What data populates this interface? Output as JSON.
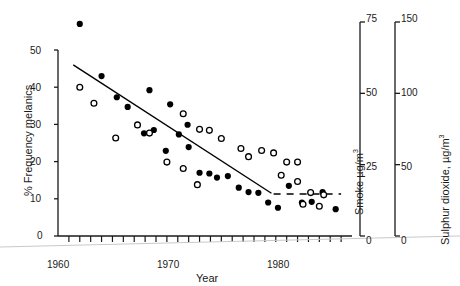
{
  "chart_data": {
    "type": "scatter",
    "title": "",
    "xlabel": "Year",
    "ylabel": "% Frequency melanics",
    "xlim": [
      1959,
      1986
    ],
    "ylim": [
      0,
      50
    ],
    "xticks": [
      1960,
      1970,
      1980
    ],
    "xtick_labels": [
      "1960",
      "1970",
      "1980"
    ],
    "xtick_minor_step": 1,
    "yticks": [
      0,
      10,
      20,
      30,
      40,
      50
    ],
    "ytick_labels": [
      "0",
      "10",
      "20",
      "30",
      "40",
      "50"
    ],
    "grid": false,
    "legend": "none",
    "axes": [
      {
        "id": "left",
        "label": "% Frequency melanics",
        "position": "left",
        "ticks": [
          0,
          10,
          20,
          30,
          40,
          50
        ],
        "tick_labels": [
          "0",
          "10",
          "20",
          "30",
          "40",
          "50"
        ],
        "range": [
          0,
          50
        ]
      },
      {
        "id": "smoke",
        "label": "Smoke µg/m",
        "label_exponent": "3",
        "position": "right-inner",
        "ticks": [
          0,
          25,
          50,
          75
        ],
        "tick_labels": [
          "0",
          "25",
          "50",
          "75"
        ],
        "range": [
          0,
          75
        ]
      },
      {
        "id": "so2",
        "label": "Sulphur dioxide, µg/m",
        "label_exponent": "3",
        "position": "right-outer",
        "ticks": [
          0,
          50,
          100,
          150
        ],
        "tick_labels": [
          "0",
          "50",
          "100",
          "150"
        ],
        "range": [
          0,
          150
        ]
      }
    ],
    "series": [
      {
        "name": "melanic frequency",
        "marker": "filled-circle",
        "color": "#000000",
        "axis": "left",
        "points": [
          {
            "x": 1961,
            "y": 57
          },
          {
            "x": 1963,
            "y": 43
          },
          {
            "x": 1964.4,
            "y": 37.3
          },
          {
            "x": 1965.4,
            "y": 34.7
          },
          {
            "x": 1967.4,
            "y": 39.2
          },
          {
            "x": 1969.3,
            "y": 35.4
          },
          {
            "x": 1970.9,
            "y": 29.9
          },
          {
            "x": 1966.9,
            "y": 27.6
          },
          {
            "x": 1967.8,
            "y": 28.5
          },
          {
            "x": 1970.1,
            "y": 27.3
          },
          {
            "x": 1968.9,
            "y": 22.9
          },
          {
            "x": 1971.0,
            "y": 23.9
          },
          {
            "x": 1972.0,
            "y": 17.0
          },
          {
            "x": 1972.9,
            "y": 16.8
          },
          {
            "x": 1973.6,
            "y": 15.7
          },
          {
            "x": 1974.6,
            "y": 16.1
          },
          {
            "x": 1975.6,
            "y": 13.0
          },
          {
            "x": 1976.5,
            "y": 11.8
          },
          {
            "x": 1977.4,
            "y": 11.6
          },
          {
            "x": 1978.3,
            "y": 9.0
          },
          {
            "x": 1979.2,
            "y": 7.6
          },
          {
            "x": 1980.2,
            "y": 13.5
          },
          {
            "x": 1981.4,
            "y": 9.0
          },
          {
            "x": 1982.3,
            "y": 9.2
          },
          {
            "x": 1983.3,
            "y": 11.8
          },
          {
            "x": 1984.5,
            "y": 7.2
          }
        ]
      },
      {
        "name": "pollution measure",
        "marker": "open-circle",
        "color": "#000000",
        "axis": "smoke",
        "points": [
          {
            "x": 1961,
            "y": 60
          },
          {
            "x": 1962.3,
            "y": 53.5
          },
          {
            "x": 1964.3,
            "y": 39.5
          },
          {
            "x": 1966.3,
            "y": 44.8
          },
          {
            "x": 1967.4,
            "y": 41.5
          },
          {
            "x": 1970.5,
            "y": 49.3
          },
          {
            "x": 1972.0,
            "y": 43.0
          },
          {
            "x": 1972.9,
            "y": 42.6
          },
          {
            "x": 1974.0,
            "y": 39.3
          },
          {
            "x": 1975.8,
            "y": 35.3
          },
          {
            "x": 1969.0,
            "y": 29.8
          },
          {
            "x": 1970.5,
            "y": 27.2
          },
          {
            "x": 1971.8,
            "y": 20.7
          },
          {
            "x": 1976.5,
            "y": 32.0
          },
          {
            "x": 1977.7,
            "y": 34.5
          },
          {
            "x": 1978.8,
            "y": 33.5
          },
          {
            "x": 1980.0,
            "y": 29.8
          },
          {
            "x": 1981.0,
            "y": 29.8
          },
          {
            "x": 1979.5,
            "y": 24.5
          },
          {
            "x": 1981.0,
            "y": 22.0
          },
          {
            "x": 1982.2,
            "y": 17.5
          },
          {
            "x": 1983.4,
            "y": 16.6
          },
          {
            "x": 1981.5,
            "y": 12.8
          },
          {
            "x": 1983.0,
            "y": 12.0
          }
        ]
      }
    ],
    "trend_lines": [
      {
        "name": "regression-line",
        "style": "solid",
        "x0": 1960.4,
        "y0": 46.0,
        "x1": 1978.6,
        "y1": 11.5
      },
      {
        "name": "dashed-baseline",
        "style": "dashed",
        "x0": 1978.8,
        "y0": 11.3,
        "x1": 1985.0,
        "y1": 11.3
      }
    ]
  }
}
